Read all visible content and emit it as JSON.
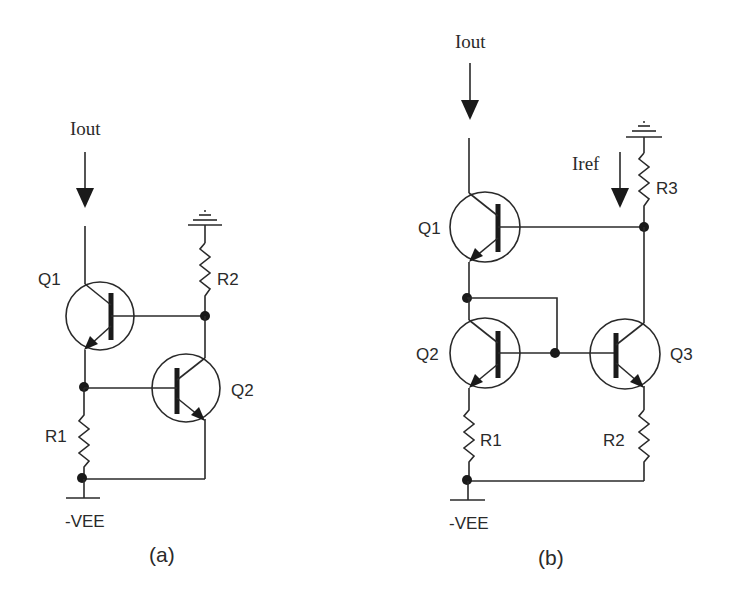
{
  "diagrams": [
    {
      "id": "a",
      "caption": "(a)",
      "current_label": "Iout",
      "supply_label": "-VEE",
      "transistors": [
        {
          "label": "Q1"
        },
        {
          "label": "Q2"
        }
      ],
      "resistors": [
        {
          "label": "R1"
        },
        {
          "label": "R2"
        }
      ]
    },
    {
      "id": "b",
      "caption": "(b)",
      "current_label": "Iout",
      "reference_label": "Iref",
      "supply_label": "-VEE",
      "transistors": [
        {
          "label": "Q1"
        },
        {
          "label": "Q2"
        },
        {
          "label": "Q3"
        }
      ],
      "resistors": [
        {
          "label": "R1"
        },
        {
          "label": "R2"
        },
        {
          "label": "R3"
        }
      ]
    }
  ],
  "colors": {
    "line": "#2a2a2a",
    "background": "#ffffff"
  }
}
